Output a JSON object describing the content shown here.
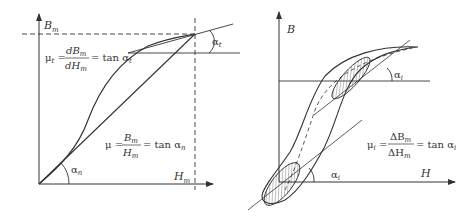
{
  "left_diagram": {
    "title": "Static and differential permeability",
    "y_axis_label": "B",
    "y_axis_sub": "m",
    "x_axis_label": "H",
    "x_axis_sub": "m",
    "angle_t": {
      "greek": "α",
      "sub": "t"
    },
    "angle_n": {
      "greek": "α",
      "sub": "n"
    },
    "formula_t": {
      "lhs": "μ",
      "lhs_sub": "t",
      "num": "dB",
      "num_sub": "m",
      "den": "dH",
      "den_sub": "m",
      "rhs": "= tan α",
      "rhs_sub": "t"
    },
    "formula_n": {
      "lhs": "μ",
      "num": "B",
      "num_sub": "m",
      "den": "H",
      "den_sub": "m",
      "rhs": "= tan α",
      "rhs_sub": "n"
    }
  },
  "right_diagram": {
    "title": "Incremental permeability on hysteresis loop",
    "y_axis_label": "B",
    "x_axis_label": "H",
    "angle_i_top": {
      "greek": "α",
      "sub": "i"
    },
    "angle_i_bottom": {
      "greek": "α",
      "sub": "i"
    },
    "formula_i": {
      "lhs": "μ",
      "lhs_sub": "i",
      "num": "ΔB",
      "num_sub": "m",
      "den": "ΔH",
      "den_sub": "m",
      "rhs": "= tan α",
      "rhs_sub": "i"
    }
  },
  "colors": {
    "stroke": "#333333",
    "background": "#ffffff"
  }
}
